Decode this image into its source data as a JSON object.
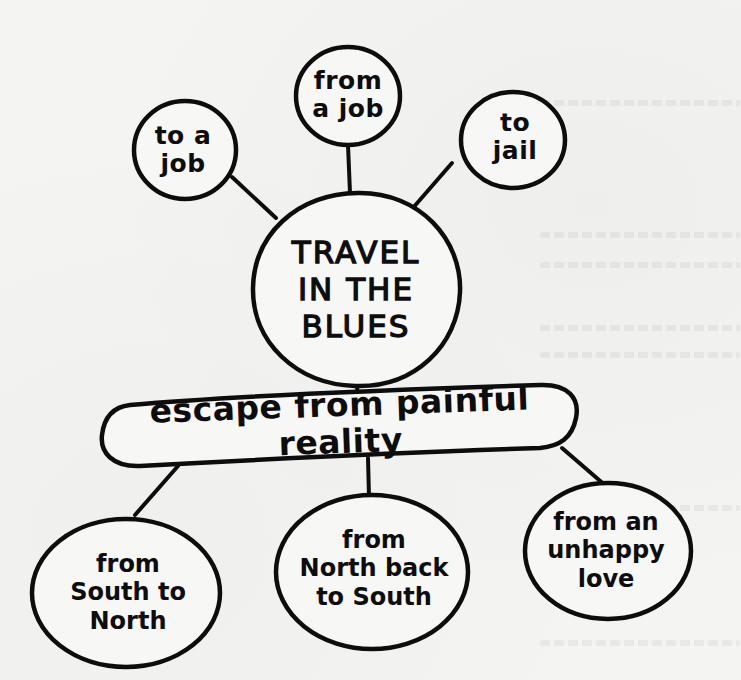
{
  "diagram": {
    "type": "concept-map",
    "center": {
      "id": "center",
      "label": "TRAVEL\nIN THE\nBLUES"
    },
    "top_branches": [
      {
        "id": "to-a-job",
        "label": "to a\njob"
      },
      {
        "id": "from-a-job",
        "label": "from\na job"
      },
      {
        "id": "to-jail",
        "label": "to\njail"
      }
    ],
    "theme": {
      "id": "escape",
      "label": "escape from painful reality"
    },
    "bottom_branches": [
      {
        "id": "south-to-north",
        "label": "from\nSouth to\nNorth"
      },
      {
        "id": "north-back-to-south",
        "label": "from\nNorth back\nto South"
      },
      {
        "id": "unhappy-love",
        "label": "from an\nunhappy\nlove"
      }
    ],
    "edges": [
      [
        "center",
        "to-a-job"
      ],
      [
        "center",
        "from-a-job"
      ],
      [
        "center",
        "to-jail"
      ],
      [
        "center",
        "escape"
      ],
      [
        "escape",
        "south-to-north"
      ],
      [
        "escape",
        "north-back-to-south"
      ],
      [
        "escape",
        "unhappy-love"
      ]
    ],
    "colors": {
      "ink": "#0d0d0d",
      "paper": "#f4f4f3"
    }
  }
}
